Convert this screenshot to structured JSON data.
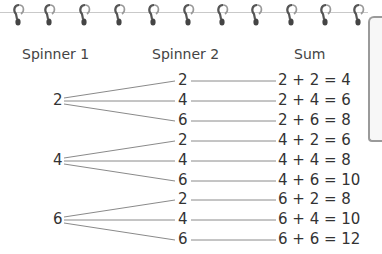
{
  "headers": {
    "spinner1": "Spinner 1",
    "spinner2": "Spinner 2",
    "sum": "Sum"
  },
  "spinner1": [
    {
      "value": "2",
      "y": 101
    },
    {
      "value": "4",
      "y": 161
    },
    {
      "value": "6",
      "y": 220
    }
  ],
  "rows": [
    {
      "s2": "2",
      "sum": "2 + 2 = 4",
      "y": 81
    },
    {
      "s2": "4",
      "sum": "2 + 4 = 6",
      "y": 101
    },
    {
      "s2": "6",
      "sum": "2 + 6 = 8",
      "y": 121
    },
    {
      "s2": "2",
      "sum": "4 + 2 = 6",
      "y": 141
    },
    {
      "s2": "4",
      "sum": "4 + 4 = 8",
      "y": 161
    },
    {
      "s2": "6",
      "sum": "4 + 6 = 10",
      "y": 181
    },
    {
      "s2": "2",
      "sum": "6 + 2 = 8",
      "y": 200
    },
    {
      "s2": "4",
      "sum": "6 + 4 = 10",
      "y": 220
    },
    {
      "s2": "6",
      "sum": "6 + 6 = 12",
      "y": 240
    }
  ],
  "colors": {
    "line": "#8a8a8a",
    "text": "#333333",
    "ring": "#555555"
  }
}
